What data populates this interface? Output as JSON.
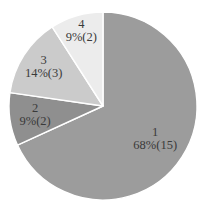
{
  "chart_data": {
    "type": "pie",
    "title": "",
    "categories": [
      "1",
      "2",
      "3",
      "4"
    ],
    "values": [
      15,
      2,
      3,
      2
    ],
    "percents": [
      68,
      9,
      14,
      9
    ],
    "slice_labels": [
      "68%(15)",
      "9%(2)",
      "14%(3)",
      "9%(2)"
    ],
    "total": 22,
    "colors": [
      "#9c9c9c",
      "#8f8f8f",
      "#cbcbcb",
      "#ececec"
    ],
    "label_color": "#3a3a3a",
    "separator_color": "#ffffff",
    "background": "#ffffff",
    "legend": "none",
    "layout": {
      "cx": 103,
      "cy": 106,
      "r": 94,
      "start_angle_deg": 0,
      "direction": "clockwise",
      "label_radius": [
        0.66,
        0.73,
        0.75,
        0.82
      ],
      "label_line_offsets": [
        -4,
        9
      ]
    }
  }
}
